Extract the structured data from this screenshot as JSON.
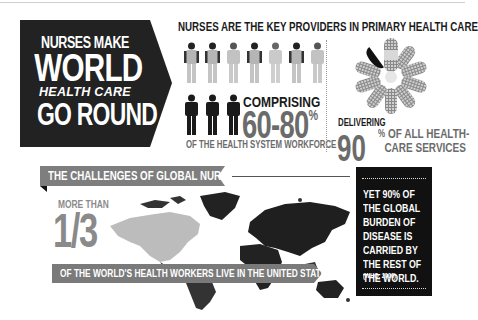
{
  "hero": {
    "line1": "NURSES MAKE",
    "line2": "WORLD",
    "line3": "HEALTH CARE",
    "line4": "GO ROUND"
  },
  "top_section": {
    "title": "NURSES ARE THE KEY PROVIDERS IN PRIMARY HEALTH CARE",
    "people_icon": "person-icon",
    "comprising_label": "COMPRISING",
    "workforce_value": "60-80",
    "workforce_unit": "%",
    "workforce_caption": "OF THE HEALTH SYSTEM WORKFORCE",
    "flower_icon": "bandage-flower-icon",
    "delivering_label": "DELIVERING",
    "services_value": "90",
    "services_unit": "%",
    "services_caption_line1": "OF ALL HEALTH-",
    "services_caption_line2": "CARE SERVICES"
  },
  "bottom_section": {
    "banner_title": "THE CHALLENGES OF GLOBAL NURSES:",
    "more_than": "MORE THAN",
    "fraction": "1/3",
    "map_icon": "world-map-icon",
    "caption": "OF THE WORLD'S HEALTH WORKERS LIVE IN THE UNITED STATES AND CANADA",
    "side_note": "YET 90% OF THE GLOBAL BURDEN OF DISEASE IS CARRIED BY THE REST OF THE WORLD.",
    "citation": "(WHO, 2006)."
  },
  "colors": {
    "dark": "#1f1f1f",
    "gray": "#6b6b6b",
    "light_gray": "#bdbdbd",
    "banner_gray": "#808080"
  }
}
